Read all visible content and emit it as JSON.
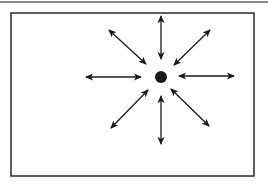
{
  "diagram": {
    "type": "radial-expansion",
    "frame": {
      "x": 11,
      "y": 13,
      "width": 243,
      "height": 163,
      "stroke": "#2a2a2a"
    },
    "top_rule": {
      "color": "#8a8a8a"
    },
    "center_dot": {
      "cx": 161,
      "cy": 77,
      "r": 6,
      "fill": "#1a1a1a"
    },
    "arrow_color": "#1a1a1a",
    "arrows": [
      {
        "name": "up",
        "x1": 161,
        "y1": 59,
        "x2": 161,
        "y2": 16
      },
      {
        "name": "down",
        "x1": 161,
        "y1": 96,
        "x2": 161,
        "y2": 144
      },
      {
        "name": "left",
        "x1": 141,
        "y1": 77,
        "x2": 86,
        "y2": 77
      },
      {
        "name": "right",
        "x1": 179,
        "y1": 76,
        "x2": 234,
        "y2": 76
      },
      {
        "name": "up-left",
        "x1": 146,
        "y1": 64,
        "x2": 109,
        "y2": 30
      },
      {
        "name": "up-right",
        "x1": 174,
        "y1": 65,
        "x2": 210,
        "y2": 30
      },
      {
        "name": "down-left",
        "x1": 148,
        "y1": 90,
        "x2": 111,
        "y2": 128
      },
      {
        "name": "down-right",
        "x1": 171,
        "y1": 89,
        "x2": 209,
        "y2": 126
      }
    ]
  }
}
